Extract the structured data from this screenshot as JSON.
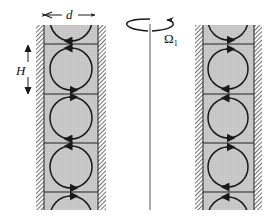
{
  "diagram": {
    "type": "taylor-couette-vortex-cells",
    "labels": {
      "gap_width": "d",
      "cell_height": "H",
      "rotation": "Ω",
      "rotation_subscript": "1"
    },
    "colors": {
      "fluid": "#c8c8c8",
      "line": "#1a1a1a",
      "wall_hatch": "#333333",
      "axis": "#555555",
      "background": "#ffffff"
    },
    "columns": [
      {
        "name": "left-gap",
        "cells": [
          {
            "index": 0,
            "rotation": "clockwise",
            "partial": "top"
          },
          {
            "index": 1,
            "rotation": "counterclockwise"
          },
          {
            "index": 2,
            "rotation": "clockwise"
          },
          {
            "index": 3,
            "rotation": "counterclockwise"
          },
          {
            "index": 4,
            "rotation": "clockwise",
            "partial": "bottom"
          }
        ]
      },
      {
        "name": "right-gap",
        "cells": [
          {
            "index": 0,
            "rotation": "counterclockwise",
            "partial": "top"
          },
          {
            "index": 1,
            "rotation": "clockwise"
          },
          {
            "index": 2,
            "rotation": "counterclockwise"
          },
          {
            "index": 3,
            "rotation": "clockwise"
          },
          {
            "index": 4,
            "rotation": "counterclockwise",
            "partial": "bottom"
          }
        ]
      }
    ]
  }
}
